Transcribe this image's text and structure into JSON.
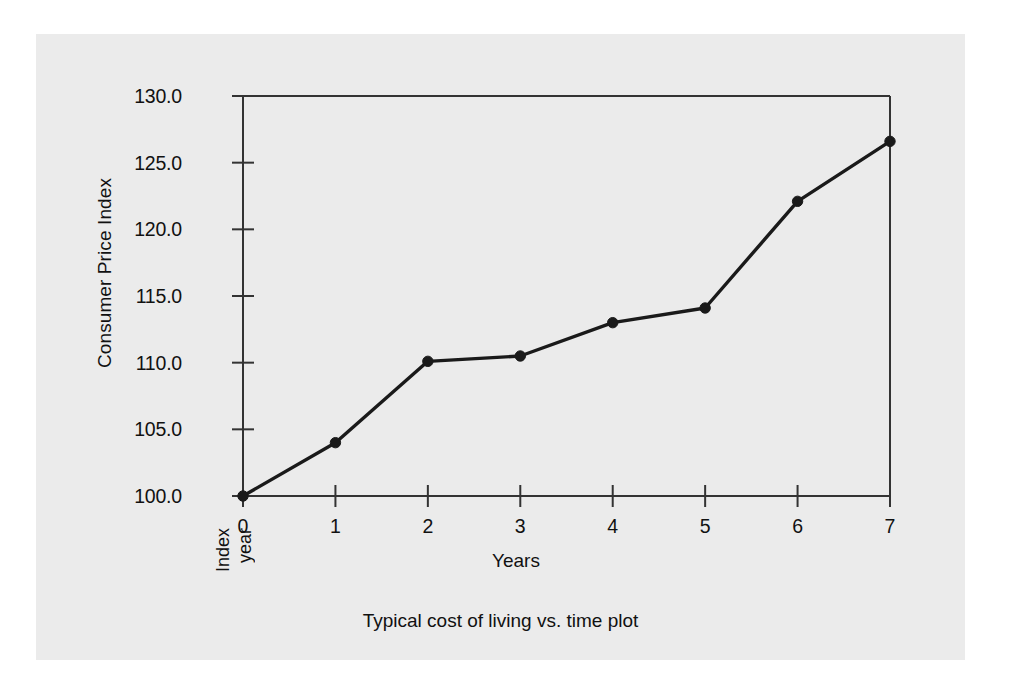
{
  "chart_data": {
    "type": "line",
    "title": "",
    "caption": "Typical cost of living vs. time plot",
    "xlabel": "Years",
    "ylabel": "Consumer Price Index",
    "x": [
      0,
      1,
      2,
      3,
      4,
      5,
      6,
      7
    ],
    "values": [
      100.0,
      104.0,
      110.1,
      110.5,
      113.0,
      114.1,
      122.1,
      126.6
    ],
    "series": [
      {
        "name": "Consumer Price Index",
        "values": [
          100.0,
          104.0,
          110.1,
          110.5,
          113.0,
          114.1,
          122.1,
          126.6
        ]
      }
    ],
    "xlim": [
      0,
      7
    ],
    "ylim": [
      100.0,
      130.0
    ],
    "xticks": [
      0,
      1,
      2,
      3,
      4,
      5,
      6,
      7
    ],
    "xtick_labels": [
      "0",
      "1",
      "2",
      "3",
      "4",
      "5",
      "6",
      "7"
    ],
    "yticks": [
      100.0,
      105.0,
      110.0,
      115.0,
      120.0,
      125.0,
      130.0
    ],
    "ytick_labels": [
      "100.0",
      "105.0",
      "110.0",
      "115.0",
      "120.0",
      "125.0",
      "130.0"
    ],
    "grid": false,
    "legend": null,
    "marker": "filled-circle",
    "line_color": "#1a1a1a",
    "marker_color": "#1a1a1a",
    "axis_color": "#333333",
    "background_color": "#ebebeb",
    "annotations": [
      {
        "name": "index-year",
        "lines": [
          "Index",
          "year"
        ],
        "at_x": 0,
        "rotation": "vertical"
      }
    ]
  },
  "figure": {
    "y_axis_title": "Consumer Price Index",
    "x_axis_title": "Years",
    "caption": "Typical cost of living vs. time plot",
    "index_year_line1": "Index",
    "index_year_line2": "year"
  }
}
